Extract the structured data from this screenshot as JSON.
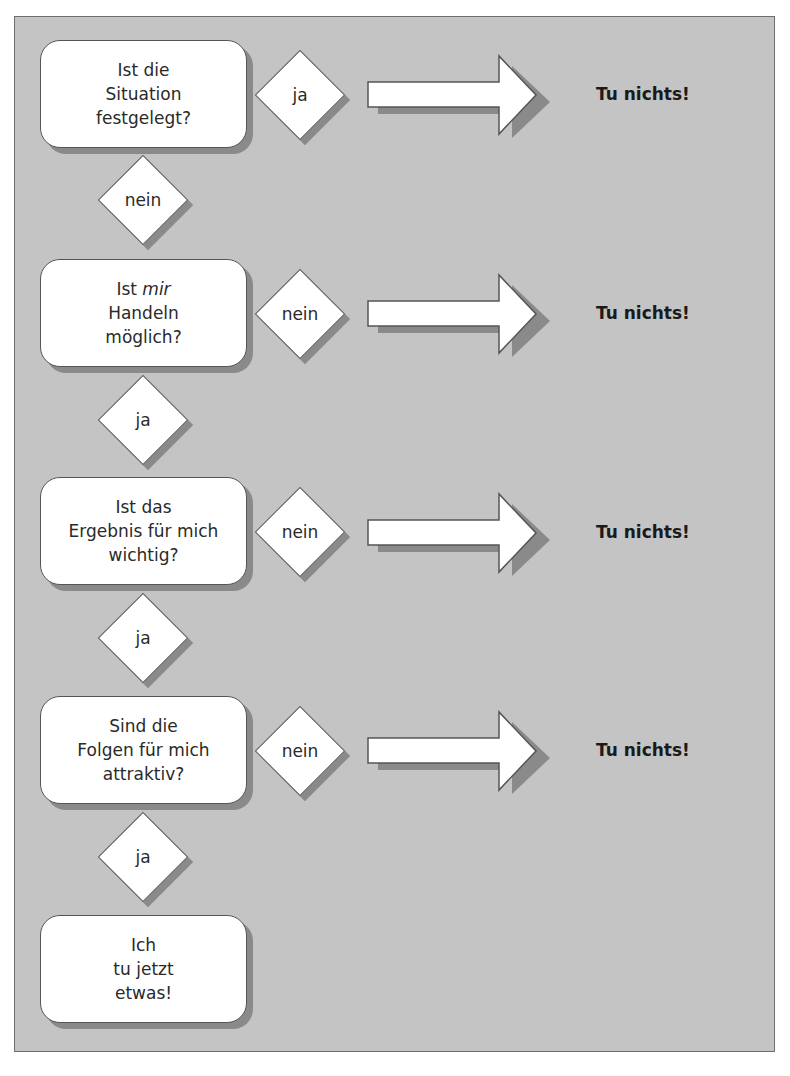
{
  "diagram": {
    "type": "flowchart",
    "colors": {
      "background": "#c4c4c4",
      "frame_border": "#6e6e6e",
      "node_fill": "#ffffff",
      "shadow": "#8a8a8a",
      "text": "#2a2a2a"
    },
    "questions": [
      {
        "lines": [
          "Ist die",
          "Situation",
          "festgelegt?"
        ],
        "exit_label": "nein-exit",
        "side_label": "ja",
        "down_label": "nein",
        "result": "Tu nichts!"
      },
      {
        "lines_html": true,
        "line1_prefix": "Ist ",
        "line1_emph": "mir",
        "lines": [
          "Ist mir",
          "Handeln",
          "möglich?"
        ],
        "side_label": "nein",
        "down_label": "ja",
        "result": "Tu nichts!"
      },
      {
        "lines": [
          "Ist das",
          "Ergebnis für mich",
          "wichtig?"
        ],
        "side_label": "nein",
        "down_label": "ja",
        "result": "Tu nichts!"
      },
      {
        "lines": [
          "Sind die",
          "Folgen für mich",
          "attraktiv?"
        ],
        "side_label": "nein",
        "down_label": "ja",
        "result": "Tu nichts!"
      }
    ],
    "final": {
      "lines": [
        "Ich",
        "tu jetzt",
        "etwas!"
      ]
    }
  }
}
